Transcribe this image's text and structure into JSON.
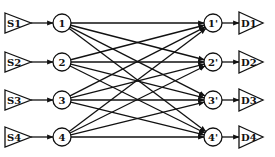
{
  "diagram": {
    "type": "bipartite-network",
    "colors": {
      "stroke": "#111111",
      "background": "#ffffff"
    },
    "sources": [
      {
        "id": "S1",
        "label": "S1",
        "y": 23
      },
      {
        "id": "S2",
        "label": "S2",
        "y": 62
      },
      {
        "id": "S3",
        "label": "S3",
        "y": 100
      },
      {
        "id": "S4",
        "label": "S4",
        "y": 137
      }
    ],
    "input_nodes": [
      {
        "id": "1",
        "label": "1",
        "y": 23
      },
      {
        "id": "2",
        "label": "2",
        "y": 62
      },
      {
        "id": "3",
        "label": "3",
        "y": 100
      },
      {
        "id": "4",
        "label": "4",
        "y": 137
      }
    ],
    "output_nodes": [
      {
        "id": "1p",
        "label": "1'",
        "y": 23
      },
      {
        "id": "2p",
        "label": "2'",
        "y": 62
      },
      {
        "id": "3p",
        "label": "3'",
        "y": 100
      },
      {
        "id": "4p",
        "label": "4'",
        "y": 137
      }
    ],
    "destinations": [
      {
        "id": "D1",
        "label": "D1",
        "y": 23
      },
      {
        "id": "D2",
        "label": "D2",
        "y": 62
      },
      {
        "id": "D3",
        "label": "D3",
        "y": 100
      },
      {
        "id": "D4",
        "label": "D4",
        "y": 137
      }
    ],
    "edges": "every input node i connects to every output node j' (complete bipartite)"
  }
}
